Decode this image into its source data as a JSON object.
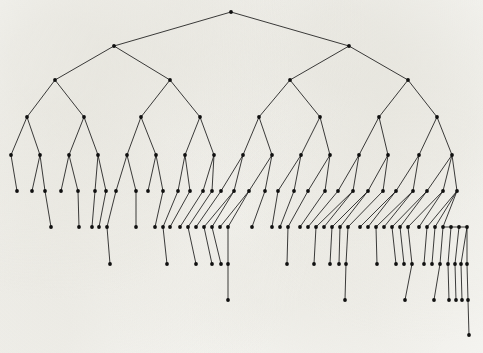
{
  "figure": {
    "kind": "binary-tree-diagram",
    "title": "",
    "caption": "",
    "width": 483,
    "height": 353,
    "background_color": "#fbfbf9",
    "edge_color": "#1b1b1b",
    "node_color": "#101010",
    "node_radius": 1.9,
    "edge_width": 0.85
  },
  "chart_data": {
    "type": "diagram",
    "subtype": "binary-tree",
    "title": "",
    "xlabel": "",
    "ylabel": "",
    "grid": false,
    "legend": null,
    "level_y": [
      12,
      46,
      80,
      117,
      155,
      191,
      227,
      264,
      300,
      335
    ],
    "level_counts": [
      1,
      2,
      4,
      8,
      16,
      28,
      37,
      29,
      8,
      1
    ],
    "max_depth": 10,
    "node_count": 134,
    "nodes": [
      {
        "id": 0,
        "x": 231,
        "y": 12,
        "level": 0
      },
      {
        "id": 1,
        "x": 114,
        "y": 46,
        "level": 1
      },
      {
        "id": 2,
        "x": 349,
        "y": 46,
        "level": 1
      },
      {
        "id": 3,
        "x": 55,
        "y": 80,
        "level": 2
      },
      {
        "id": 4,
        "x": 170,
        "y": 80,
        "level": 2
      },
      {
        "id": 5,
        "x": 290,
        "y": 80,
        "level": 2
      },
      {
        "id": 6,
        "x": 408,
        "y": 80,
        "level": 2
      },
      {
        "id": 7,
        "x": 27,
        "y": 117,
        "level": 3
      },
      {
        "id": 8,
        "x": 84,
        "y": 117,
        "level": 3
      },
      {
        "id": 9,
        "x": 141,
        "y": 117,
        "level": 3
      },
      {
        "id": 10,
        "x": 200,
        "y": 117,
        "level": 3
      },
      {
        "id": 11,
        "x": 259,
        "y": 117,
        "level": 3
      },
      {
        "id": 12,
        "x": 320,
        "y": 117,
        "level": 3
      },
      {
        "id": 13,
        "x": 379,
        "y": 117,
        "level": 3
      },
      {
        "id": 14,
        "x": 437,
        "y": 117,
        "level": 3
      },
      {
        "id": 15,
        "x": 11,
        "y": 155,
        "level": 4
      },
      {
        "id": 16,
        "x": 40,
        "y": 155,
        "level": 4
      },
      {
        "id": 17,
        "x": 69,
        "y": 155,
        "level": 4
      },
      {
        "id": 18,
        "x": 98,
        "y": 155,
        "level": 4
      },
      {
        "id": 19,
        "x": 127,
        "y": 155,
        "level": 4
      },
      {
        "id": 20,
        "x": 156,
        "y": 155,
        "level": 4
      },
      {
        "id": 21,
        "x": 185,
        "y": 155,
        "level": 4
      },
      {
        "id": 22,
        "x": 214,
        "y": 155,
        "level": 4
      },
      {
        "id": 23,
        "x": 243,
        "y": 155,
        "level": 4
      },
      {
        "id": 24,
        "x": 272,
        "y": 155,
        "level": 4
      },
      {
        "id": 25,
        "x": 301,
        "y": 155,
        "level": 4
      },
      {
        "id": 26,
        "x": 330,
        "y": 155,
        "level": 4
      },
      {
        "id": 27,
        "x": 359,
        "y": 155,
        "level": 4
      },
      {
        "id": 28,
        "x": 388,
        "y": 155,
        "level": 4
      },
      {
        "id": 29,
        "x": 419,
        "y": 155,
        "level": 4
      },
      {
        "id": 30,
        "x": 452,
        "y": 155,
        "level": 4
      },
      {
        "id": 31,
        "x": 17,
        "y": 191,
        "level": 5
      },
      {
        "id": 32,
        "x": 32,
        "y": 191,
        "level": 5
      },
      {
        "id": 33,
        "x": 45,
        "y": 191,
        "level": 5
      },
      {
        "id": 34,
        "x": 61,
        "y": 191,
        "level": 5
      },
      {
        "id": 35,
        "x": 78,
        "y": 191,
        "level": 5
      },
      {
        "id": 36,
        "x": 95,
        "y": 191,
        "level": 5
      },
      {
        "id": 37,
        "x": 106,
        "y": 191,
        "level": 5
      },
      {
        "id": 38,
        "x": 116,
        "y": 191,
        "level": 5
      },
      {
        "id": 39,
        "x": 136,
        "y": 191,
        "level": 5
      },
      {
        "id": 40,
        "x": 148,
        "y": 191,
        "level": 5
      },
      {
        "id": 41,
        "x": 163,
        "y": 191,
        "level": 5
      },
      {
        "id": 42,
        "x": 178,
        "y": 191,
        "level": 5
      },
      {
        "id": 43,
        "x": 190,
        "y": 191,
        "level": 5
      },
      {
        "id": 44,
        "x": 203,
        "y": 191,
        "level": 5
      },
      {
        "id": 45,
        "x": 212,
        "y": 191,
        "level": 5
      },
      {
        "id": 46,
        "x": 221,
        "y": 191,
        "level": 5
      },
      {
        "id": 47,
        "x": 234,
        "y": 191,
        "level": 5
      },
      {
        "id": 48,
        "x": 249,
        "y": 191,
        "level": 5
      },
      {
        "id": 49,
        "x": 265,
        "y": 191,
        "level": 5
      },
      {
        "id": 50,
        "x": 278,
        "y": 191,
        "level": 5
      },
      {
        "id": 51,
        "x": 294,
        "y": 191,
        "level": 5
      },
      {
        "id": 52,
        "x": 308,
        "y": 191,
        "level": 5
      },
      {
        "id": 53,
        "x": 325,
        "y": 191,
        "level": 5
      },
      {
        "id": 54,
        "x": 338,
        "y": 191,
        "level": 5
      },
      {
        "id": 55,
        "x": 353,
        "y": 191,
        "level": 5
      },
      {
        "id": 56,
        "x": 368,
        "y": 191,
        "level": 5
      },
      {
        "id": 57,
        "x": 383,
        "y": 191,
        "level": 5
      },
      {
        "id": 58,
        "x": 396,
        "y": 191,
        "level": 5
      },
      {
        "id": 59,
        "x": 413,
        "y": 191,
        "level": 5
      },
      {
        "id": 60,
        "x": 427,
        "y": 191,
        "level": 5
      },
      {
        "id": 61,
        "x": 443,
        "y": 191,
        "level": 5
      },
      {
        "id": 62,
        "x": 457,
        "y": 191,
        "level": 5
      },
      {
        "id": 63,
        "x": 51,
        "y": 227,
        "level": 6
      },
      {
        "id": 64,
        "x": 79,
        "y": 227,
        "level": 6
      },
      {
        "id": 65,
        "x": 92,
        "y": 227,
        "level": 6
      },
      {
        "id": 66,
        "x": 99,
        "y": 227,
        "level": 6
      },
      {
        "id": 67,
        "x": 107,
        "y": 227,
        "level": 6
      },
      {
        "id": 68,
        "x": 136,
        "y": 227,
        "level": 6
      },
      {
        "id": 69,
        "x": 155,
        "y": 227,
        "level": 6
      },
      {
        "id": 70,
        "x": 163,
        "y": 227,
        "level": 6
      },
      {
        "id": 71,
        "x": 170,
        "y": 227,
        "level": 6
      },
      {
        "id": 72,
        "x": 180,
        "y": 227,
        "level": 6
      },
      {
        "id": 73,
        "x": 188,
        "y": 227,
        "level": 6
      },
      {
        "id": 74,
        "x": 196,
        "y": 227,
        "level": 6
      },
      {
        "id": 75,
        "x": 204,
        "y": 227,
        "level": 6
      },
      {
        "id": 76,
        "x": 212,
        "y": 227,
        "level": 6
      },
      {
        "id": 77,
        "x": 220,
        "y": 227,
        "level": 6
      },
      {
        "id": 78,
        "x": 228,
        "y": 227,
        "level": 6
      },
      {
        "id": 79,
        "x": 252,
        "y": 227,
        "level": 6
      },
      {
        "id": 80,
        "x": 272,
        "y": 227,
        "level": 6
      },
      {
        "id": 81,
        "x": 280,
        "y": 227,
        "level": 6
      },
      {
        "id": 82,
        "x": 288,
        "y": 227,
        "level": 6
      },
      {
        "id": 83,
        "x": 300,
        "y": 227,
        "level": 6
      },
      {
        "id": 84,
        "x": 308,
        "y": 227,
        "level": 6
      },
      {
        "id": 85,
        "x": 316,
        "y": 227,
        "level": 6
      },
      {
        "id": 86,
        "x": 324,
        "y": 227,
        "level": 6
      },
      {
        "id": 87,
        "x": 332,
        "y": 227,
        "level": 6
      },
      {
        "id": 88,
        "x": 340,
        "y": 227,
        "level": 6
      },
      {
        "id": 89,
        "x": 348,
        "y": 227,
        "level": 6
      },
      {
        "id": 90,
        "x": 360,
        "y": 227,
        "level": 6
      },
      {
        "id": 91,
        "x": 368,
        "y": 227,
        "level": 6
      },
      {
        "id": 92,
        "x": 376,
        "y": 227,
        "level": 6
      },
      {
        "id": 93,
        "x": 384,
        "y": 227,
        "level": 6
      },
      {
        "id": 94,
        "x": 392,
        "y": 227,
        "level": 6
      },
      {
        "id": 95,
        "x": 400,
        "y": 227,
        "level": 6
      },
      {
        "id": 96,
        "x": 408,
        "y": 227,
        "level": 6
      },
      {
        "id": 97,
        "x": 419,
        "y": 227,
        "level": 6
      },
      {
        "id": 98,
        "x": 427,
        "y": 227,
        "level": 6
      },
      {
        "id": 99,
        "x": 435,
        "y": 227,
        "level": 6
      },
      {
        "id": 100,
        "x": 443,
        "y": 227,
        "level": 6
      },
      {
        "id": 101,
        "x": 451,
        "y": 227,
        "level": 6
      },
      {
        "id": 102,
        "x": 459,
        "y": 227,
        "level": 6
      },
      {
        "id": 103,
        "x": 467,
        "y": 227,
        "level": 6
      },
      {
        "id": 104,
        "x": 110,
        "y": 264,
        "level": 7
      },
      {
        "id": 105,
        "x": 167,
        "y": 264,
        "level": 7
      },
      {
        "id": 106,
        "x": 196,
        "y": 264,
        "level": 7
      },
      {
        "id": 107,
        "x": 212,
        "y": 264,
        "level": 7
      },
      {
        "id": 108,
        "x": 221,
        "y": 264,
        "level": 7
      },
      {
        "id": 109,
        "x": 228,
        "y": 264,
        "level": 7
      },
      {
        "id": 110,
        "x": 287,
        "y": 264,
        "level": 7
      },
      {
        "id": 111,
        "x": 314,
        "y": 264,
        "level": 7
      },
      {
        "id": 112,
        "x": 330,
        "y": 264,
        "level": 7
      },
      {
        "id": 113,
        "x": 339,
        "y": 264,
        "level": 7
      },
      {
        "id": 114,
        "x": 346,
        "y": 264,
        "level": 7
      },
      {
        "id": 115,
        "x": 377,
        "y": 264,
        "level": 7
      },
      {
        "id": 116,
        "x": 396,
        "y": 264,
        "level": 7
      },
      {
        "id": 117,
        "x": 404,
        "y": 264,
        "level": 7
      },
      {
        "id": 118,
        "x": 412,
        "y": 264,
        "level": 7
      },
      {
        "id": 119,
        "x": 424,
        "y": 264,
        "level": 7
      },
      {
        "id": 120,
        "x": 432,
        "y": 264,
        "level": 7
      },
      {
        "id": 121,
        "x": 440,
        "y": 264,
        "level": 7
      },
      {
        "id": 122,
        "x": 448,
        "y": 264,
        "level": 7
      },
      {
        "id": 123,
        "x": 455,
        "y": 264,
        "level": 7
      },
      {
        "id": 124,
        "x": 461,
        "y": 264,
        "level": 7
      },
      {
        "id": 125,
        "x": 467,
        "y": 264,
        "level": 7
      },
      {
        "id": 126,
        "x": 228,
        "y": 300,
        "level": 8
      },
      {
        "id": 127,
        "x": 345,
        "y": 300,
        "level": 8
      },
      {
        "id": 128,
        "x": 405,
        "y": 300,
        "level": 8
      },
      {
        "id": 129,
        "x": 434,
        "y": 300,
        "level": 8
      },
      {
        "id": 130,
        "x": 449,
        "y": 300,
        "level": 8
      },
      {
        "id": 131,
        "x": 456,
        "y": 300,
        "level": 8
      },
      {
        "id": 132,
        "x": 462,
        "y": 300,
        "level": 8
      },
      {
        "id": 133,
        "x": 468,
        "y": 300,
        "level": 8
      },
      {
        "id": 134,
        "x": 469,
        "y": 335,
        "level": 9
      }
    ],
    "edges": [
      [
        0,
        1
      ],
      [
        0,
        2
      ],
      [
        1,
        3
      ],
      [
        1,
        4
      ],
      [
        2,
        5
      ],
      [
        2,
        6
      ],
      [
        3,
        7
      ],
      [
        3,
        8
      ],
      [
        4,
        9
      ],
      [
        4,
        10
      ],
      [
        5,
        11
      ],
      [
        5,
        12
      ],
      [
        6,
        13
      ],
      [
        6,
        14
      ],
      [
        7,
        15
      ],
      [
        7,
        16
      ],
      [
        8,
        17
      ],
      [
        8,
        18
      ],
      [
        9,
        19
      ],
      [
        9,
        20
      ],
      [
        10,
        21
      ],
      [
        10,
        22
      ],
      [
        11,
        23
      ],
      [
        11,
        24
      ],
      [
        12,
        25
      ],
      [
        12,
        26
      ],
      [
        13,
        27
      ],
      [
        13,
        28
      ],
      [
        14,
        29
      ],
      [
        14,
        30
      ],
      [
        15,
        31
      ],
      [
        16,
        32
      ],
      [
        16,
        33
      ],
      [
        17,
        34
      ],
      [
        17,
        35
      ],
      [
        18,
        36
      ],
      [
        18,
        37
      ],
      [
        19,
        38
      ],
      [
        19,
        39
      ],
      [
        20,
        40
      ],
      [
        20,
        41
      ],
      [
        21,
        42
      ],
      [
        21,
        43
      ],
      [
        22,
        44
      ],
      [
        22,
        45
      ],
      [
        23,
        46
      ],
      [
        23,
        47
      ],
      [
        24,
        48
      ],
      [
        24,
        49
      ],
      [
        25,
        50
      ],
      [
        25,
        51
      ],
      [
        26,
        52
      ],
      [
        26,
        53
      ],
      [
        27,
        54
      ],
      [
        27,
        55
      ],
      [
        28,
        56
      ],
      [
        28,
        57
      ],
      [
        29,
        58
      ],
      [
        29,
        59
      ],
      [
        30,
        60
      ],
      [
        30,
        61
      ],
      [
        30,
        62
      ],
      [
        33,
        63
      ],
      [
        35,
        64
      ],
      [
        36,
        65
      ],
      [
        37,
        66
      ],
      [
        38,
        67
      ],
      [
        39,
        68
      ],
      [
        41,
        69
      ],
      [
        42,
        70
      ],
      [
        43,
        71
      ],
      [
        44,
        72
      ],
      [
        45,
        73
      ],
      [
        46,
        74
      ],
      [
        47,
        75
      ],
      [
        47,
        76
      ],
      [
        48,
        77
      ],
      [
        48,
        78
      ],
      [
        49,
        79
      ],
      [
        50,
        80
      ],
      [
        51,
        81
      ],
      [
        52,
        82
      ],
      [
        53,
        83
      ],
      [
        54,
        84
      ],
      [
        55,
        85
      ],
      [
        55,
        86
      ],
      [
        56,
        87
      ],
      [
        56,
        88
      ],
      [
        57,
        89
      ],
      [
        58,
        90
      ],
      [
        58,
        91
      ],
      [
        59,
        92
      ],
      [
        59,
        93
      ],
      [
        60,
        94
      ],
      [
        60,
        95
      ],
      [
        61,
        96
      ],
      [
        61,
        97
      ],
      [
        62,
        98
      ],
      [
        62,
        99
      ],
      [
        62,
        100
      ],
      [
        100,
        101
      ],
      [
        101,
        102
      ],
      [
        102,
        103
      ],
      [
        67,
        104
      ],
      [
        70,
        105
      ],
      [
        73,
        106
      ],
      [
        75,
        107
      ],
      [
        76,
        108
      ],
      [
        78,
        109
      ],
      [
        82,
        110
      ],
      [
        85,
        111
      ],
      [
        87,
        112
      ],
      [
        88,
        113
      ],
      [
        89,
        114
      ],
      [
        92,
        115
      ],
      [
        94,
        116
      ],
      [
        95,
        117
      ],
      [
        96,
        118
      ],
      [
        98,
        119
      ],
      [
        99,
        120
      ],
      [
        100,
        121
      ],
      [
        101,
        122
      ],
      [
        102,
        123
      ],
      [
        103,
        124
      ],
      [
        103,
        125
      ],
      [
        109,
        126
      ],
      [
        114,
        127
      ],
      [
        118,
        128
      ],
      [
        121,
        129
      ],
      [
        122,
        130
      ],
      [
        123,
        131
      ],
      [
        124,
        132
      ],
      [
        125,
        133
      ],
      [
        133,
        134
      ]
    ]
  }
}
